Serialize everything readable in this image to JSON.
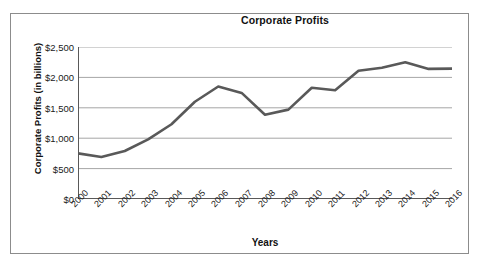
{
  "chart_data": {
    "type": "line",
    "title": "Corporate Profits",
    "xlabel": "Years",
    "ylabel": "Corporate Profits (in billions)",
    "categories": [
      "2000",
      "2001",
      "2002",
      "2003",
      "2004",
      "2005",
      "2006",
      "2007",
      "2008",
      "2009",
      "2010",
      "2011",
      "2012",
      "2013",
      "2014",
      "2015",
      "2016"
    ],
    "values": [
      750,
      690,
      790,
      980,
      1230,
      1600,
      1850,
      1745,
      1385,
      1470,
      1830,
      1790,
      2110,
      2160,
      2250,
      2140,
      2145
    ],
    "series": [
      {
        "name": "Corporate Profits",
        "values": [
          750,
          690,
          790,
          980,
          1230,
          1600,
          1850,
          1745,
          1385,
          1470,
          1830,
          1790,
          2110,
          2160,
          2250,
          2140,
          2145
        ]
      }
    ],
    "ylim": [
      0,
      2500
    ],
    "ytick_values": [
      0,
      500,
      1000,
      1500,
      2000,
      2500
    ],
    "ytick_labels": [
      "$0",
      "$500",
      "$1,000",
      "$1,500",
      "$2,000",
      "$2,500"
    ],
    "grid": "horizontal",
    "legend": "none",
    "line_color": "#595959",
    "gridline_color": "#a6a6a6",
    "axis_color": "#595959",
    "frame_color": "#8c8c8c",
    "background": "#ffffff"
  }
}
